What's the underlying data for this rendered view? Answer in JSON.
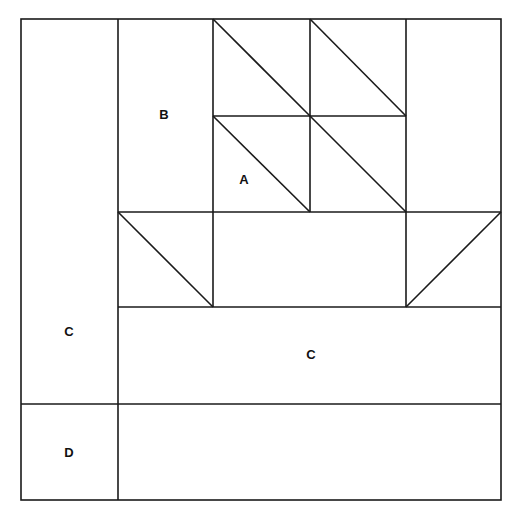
{
  "diagram": {
    "type": "quilt-block-pattern",
    "colors": {
      "line": "#1a1a1a",
      "background": "#ffffff"
    },
    "labels": [
      {
        "id": "B",
        "text": "B",
        "x": 164,
        "y": 120
      },
      {
        "id": "A",
        "text": "A",
        "x": 244,
        "y": 185
      },
      {
        "id": "C-left",
        "text": "C",
        "x": 69,
        "y": 337
      },
      {
        "id": "C-bottom",
        "text": "C",
        "x": 311,
        "y": 361
      },
      {
        "id": "D",
        "text": "D",
        "x": 69,
        "y": 458
      }
    ]
  }
}
